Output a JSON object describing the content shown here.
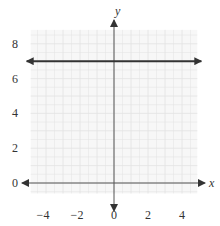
{
  "chart_data": {
    "type": "line",
    "title": "",
    "xlabel": "x",
    "ylabel": "y",
    "xlim": [
      -5,
      5
    ],
    "ylim": [
      -1,
      9
    ],
    "x_ticks": [
      -4,
      -2,
      0,
      2,
      4
    ],
    "y_ticks": [
      0,
      2,
      4,
      6,
      8
    ],
    "x_tick_labels": [
      "−4",
      "−2",
      "0",
      "2",
      "4"
    ],
    "y_tick_labels": [
      "0",
      "2",
      "4",
      "6",
      "8"
    ],
    "grid": true,
    "series": [
      {
        "name": "horizontal line",
        "equation": "y = 7",
        "x": [
          -5,
          5
        ],
        "y": [
          7,
          7
        ],
        "arrows_both_ends": true,
        "color": "#333333"
      }
    ]
  },
  "colors": {
    "grid": "#e2e2e2",
    "grid_bg": "#f7f7f7",
    "axis": "#555555",
    "line": "#333333"
  }
}
